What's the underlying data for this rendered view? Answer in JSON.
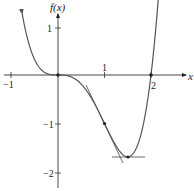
{
  "chart_data": {
    "type": "line",
    "title": "",
    "function": "f(x) = x^4 - 2x^3",
    "xlabel": "x",
    "ylabel": "f(x)",
    "xlim": [
      -1.2,
      2.3
    ],
    "ylim": [
      -2.4,
      1.5
    ],
    "x_ticks": [
      -1,
      1,
      2
    ],
    "x_tick_labels": [
      "−1",
      "1",
      "2"
    ],
    "y_ticks": [
      1,
      -1,
      -2
    ],
    "y_tick_labels": [
      "1",
      "−1",
      "−2"
    ],
    "grid": false,
    "legend": null,
    "series": [
      {
        "name": "f(x)",
        "x": [
          -0.75,
          -0.5,
          -0.25,
          0,
          0.25,
          0.5,
          0.75,
          1,
          1.25,
          1.5,
          1.75,
          2,
          2.2
        ],
        "values": [
          1.16,
          0.31,
          0.035,
          0,
          -0.027,
          -0.19,
          -0.53,
          -1,
          -1.46,
          -1.69,
          -1.34,
          0,
          1.32
        ]
      }
    ],
    "marked_points": [
      {
        "x": 0,
        "y": 0
      },
      {
        "x": 1,
        "y": -1
      },
      {
        "x": 1.5,
        "y": -1.6875
      },
      {
        "x": 2,
        "y": 0
      }
    ],
    "tangent_lines": [
      {
        "at_x": 1,
        "slope": -2,
        "from_x": 0.6,
        "to_x": 1.4
      },
      {
        "at_x": 1.5,
        "slope": 0,
        "from_x": 1.15,
        "to_x": 1.85
      }
    ]
  },
  "labels": {
    "y_axis": "f(x)",
    "x_axis": "x",
    "x_neg1": "−1",
    "x_1": "1",
    "x_2": "2",
    "y_1": "1",
    "y_neg1": "−1",
    "y_neg2": "−2"
  }
}
